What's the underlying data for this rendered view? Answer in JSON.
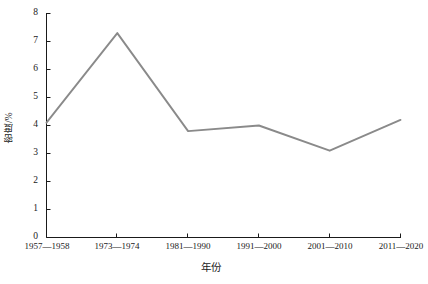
{
  "chart_data": {
    "type": "line",
    "title": "",
    "xlabel": "年份",
    "ylabel": "密度/%",
    "categories": [
      "1957—1958",
      "1973—1974",
      "1981—1990",
      "1991—2000",
      "2001—2010",
      "2011—2020"
    ],
    "values": [
      4.1,
      7.3,
      3.8,
      4.0,
      3.1,
      4.2
    ],
    "series": [
      {
        "name": "密度/%",
        "values": [
          4.1,
          7.3,
          3.8,
          4.0,
          3.1,
          4.2
        ]
      }
    ],
    "ylim": [
      0,
      8
    ],
    "ytick_labels": [
      "0",
      "1",
      "2",
      "3",
      "4",
      "5",
      "6",
      "7",
      "8"
    ],
    "ytick_values": [
      0,
      1,
      2,
      3,
      4,
      5,
      6,
      7,
      8
    ],
    "grid": false,
    "legend": false,
    "legend_position": "none",
    "line_color": "#8a8a8a",
    "axis_color": "#1a1a1a",
    "background_color": "#ffffff",
    "markers": false
  }
}
